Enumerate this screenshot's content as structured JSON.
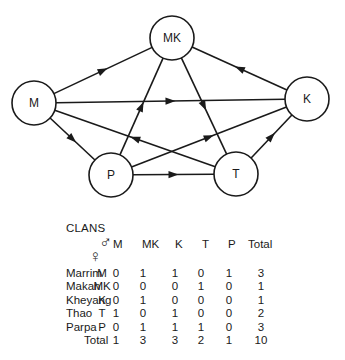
{
  "diagram": {
    "nodes": [
      {
        "id": "M",
        "label": "M",
        "cx": 34,
        "cy": 103
      },
      {
        "id": "MK",
        "label": "MK",
        "cx": 172,
        "cy": 38
      },
      {
        "id": "K",
        "label": "K",
        "cx": 307,
        "cy": 99
      },
      {
        "id": "P",
        "label": "P",
        "cx": 111,
        "cy": 175
      },
      {
        "id": "T",
        "label": "T",
        "cx": 236,
        "cy": 174
      }
    ],
    "edges": [
      {
        "from": "M",
        "to": "MK"
      },
      {
        "from": "M",
        "to": "K"
      },
      {
        "from": "M",
        "to": "P"
      },
      {
        "from": "T",
        "to": "M"
      },
      {
        "from": "K",
        "to": "MK"
      },
      {
        "from": "MK",
        "to": "T"
      },
      {
        "from": "P",
        "to": "MK"
      },
      {
        "from": "P",
        "to": "K"
      },
      {
        "from": "P",
        "to": "T"
      },
      {
        "from": "T",
        "to": "K"
      }
    ],
    "node_radius": 22
  },
  "table": {
    "title": "CLANS",
    "male_symbol": "♂",
    "female_symbol": "♀",
    "columns": [
      "M",
      "MK",
      "K",
      "T",
      "P",
      "Total"
    ],
    "rows": [
      {
        "clan": "Marrim",
        "code": "M",
        "values": [
          "0",
          "1",
          "1",
          "0",
          "1",
          "3"
        ]
      },
      {
        "clan": "Makan",
        "code": "MK",
        "values": [
          "0",
          "0",
          "0",
          "1",
          "0",
          "1"
        ]
      },
      {
        "clan": "Kheyang",
        "code": "K",
        "values": [
          "0",
          "1",
          "0",
          "0",
          "0",
          "1"
        ]
      },
      {
        "clan": "Thao",
        "code": "T",
        "values": [
          "1",
          "0",
          "1",
          "0",
          "0",
          "2"
        ]
      },
      {
        "clan": "Parpa",
        "code": "P",
        "values": [
          "0",
          "1",
          "1",
          "1",
          "0",
          "3"
        ]
      }
    ],
    "total_row": {
      "label": "Total",
      "values": [
        "1",
        "3",
        "3",
        "2",
        "1",
        "10"
      ]
    }
  }
}
